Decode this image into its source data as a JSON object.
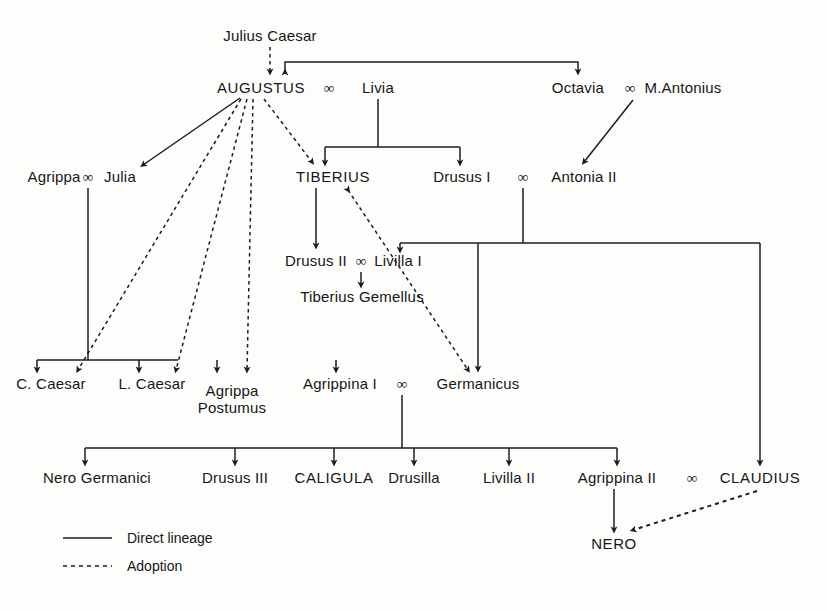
{
  "diagram": {
    "line_color": "#1c1c1c",
    "text_color": "#161616",
    "background": "#fdfdfc"
  },
  "legend": {
    "direct_label": "Direct lineage",
    "adoption_label": "Adoption"
  },
  "marriage_symbol": "∞",
  "people": [
    {
      "id": "julius_caesar",
      "label": "Julius Caesar",
      "x": 270,
      "y": 36,
      "emperor": false
    },
    {
      "id": "augustus",
      "label": "AUGUSTUS",
      "x": 261,
      "y": 88,
      "emperor": true
    },
    {
      "id": "livia",
      "label": "Livia",
      "x": 378,
      "y": 88,
      "emperor": false
    },
    {
      "id": "octavia",
      "label": "Octavia",
      "x": 578,
      "y": 88,
      "emperor": false
    },
    {
      "id": "m_antonius",
      "label": "M.Antonius",
      "x": 683,
      "y": 88,
      "emperor": false
    },
    {
      "id": "agrippa",
      "label": "Agrippa",
      "x": 54,
      "y": 177,
      "emperor": false
    },
    {
      "id": "julia",
      "label": "Julia",
      "x": 120,
      "y": 177,
      "emperor": false
    },
    {
      "id": "tiberius",
      "label": "TIBERIUS",
      "x": 333,
      "y": 177,
      "emperor": true
    },
    {
      "id": "drusus_i",
      "label": "Drusus I",
      "x": 462,
      "y": 177,
      "emperor": false
    },
    {
      "id": "antonia_ii",
      "label": "Antonia II",
      "x": 584,
      "y": 177,
      "emperor": false
    },
    {
      "id": "drusus_ii",
      "label": "Drusus II",
      "x": 316,
      "y": 261,
      "emperor": false
    },
    {
      "id": "livilla_i",
      "label": "Livilla I",
      "x": 398,
      "y": 261,
      "emperor": false
    },
    {
      "id": "tiberius_gemellus",
      "label": "Tiberius Gemellus",
      "x": 362,
      "y": 297,
      "emperor": false
    },
    {
      "id": "c_caesar",
      "label": "C. Caesar",
      "x": 51,
      "y": 384,
      "emperor": false
    },
    {
      "id": "l_caesar",
      "label": "L. Caesar",
      "x": 152,
      "y": 384,
      "emperor": false
    },
    {
      "id": "agrippa_postumus",
      "label": "Agrippa\nPostumus",
      "x": 232,
      "y": 391,
      "emperor": false
    },
    {
      "id": "agrippina_i",
      "label": "Agrippina I",
      "x": 340,
      "y": 384,
      "emperor": false
    },
    {
      "id": "germanicus",
      "label": "Germanicus",
      "x": 478,
      "y": 384,
      "emperor": false
    },
    {
      "id": "nero_germanici",
      "label": "Nero Germanici",
      "x": 97,
      "y": 478,
      "emperor": false
    },
    {
      "id": "drusus_iii",
      "label": "Drusus III",
      "x": 235,
      "y": 478,
      "emperor": false
    },
    {
      "id": "caligula",
      "label": "CALIGULA",
      "x": 334,
      "y": 478,
      "emperor": true
    },
    {
      "id": "drusilla",
      "label": "Drusilla",
      "x": 414,
      "y": 478,
      "emperor": false
    },
    {
      "id": "livilla_ii",
      "label": "Livilla II",
      "x": 509,
      "y": 478,
      "emperor": false
    },
    {
      "id": "agrippina_ii",
      "label": "Agrippina II",
      "x": 617,
      "y": 478,
      "emperor": false
    },
    {
      "id": "claudius",
      "label": "CLAUDIUS",
      "x": 760,
      "y": 478,
      "emperor": true
    },
    {
      "id": "nero",
      "label": "NERO",
      "x": 614,
      "y": 544,
      "emperor": true
    }
  ],
  "marriages": [
    {
      "id": "augustus_livia",
      "x": 329,
      "y": 88
    },
    {
      "id": "octavia_antonius",
      "x": 630,
      "y": 88
    },
    {
      "id": "agrippa_julia",
      "x": 88,
      "y": 177
    },
    {
      "id": "drusus_antonia",
      "x": 523,
      "y": 177
    },
    {
      "id": "drususii_livilla",
      "x": 361,
      "y": 261
    },
    {
      "id": "agrippina_germanicus",
      "x": 402,
      "y": 384
    },
    {
      "id": "agrippina_claudius",
      "x": 692,
      "y": 478
    }
  ],
  "edges": {
    "direct": [
      {
        "id": "jc-bar-to-augustus",
        "desc": "Julius Caesar descent bar to Augustus and Octavia"
      },
      {
        "id": "livia-to-children",
        "desc": "Livia to Tiberius and Drusus I"
      },
      {
        "id": "antonius-to-antonia",
        "desc": "M.Antonius marriage to Antonia II"
      },
      {
        "id": "tiberius-drususii",
        "desc": "Tiberius to Drusus II"
      },
      {
        "id": "drususii-gemellus",
        "desc": "Drusus II and Livilla I to Tiberius Gemellus"
      },
      {
        "id": "drusus-antonia-kids",
        "desc": "Drusus I and Antonia II to Livilla I, Germanicus, Claudius"
      },
      {
        "id": "agrippa-julia-kids",
        "desc": "Agrippa and Julia to C.Caesar, L.Caesar, Agrippa Postumus, Agrippina I"
      },
      {
        "id": "germanicus-kids",
        "desc": "Agrippina I and Germanicus to six children"
      },
      {
        "id": "agrippinaii-nero",
        "desc": "Agrippina II to Nero"
      },
      {
        "id": "augustus-julia",
        "desc": "Augustus to Julia"
      }
    ],
    "adoption": [
      {
        "id": "jc-adopts-augustus",
        "desc": "Julius Caesar adopts Augustus"
      },
      {
        "id": "augustus-adopts-ccaesar",
        "desc": "Augustus adopts C. Caesar"
      },
      {
        "id": "augustus-adopts-lcaesar",
        "desc": "Augustus adopts L. Caesar"
      },
      {
        "id": "augustus-adopts-postumus",
        "desc": "Augustus adopts Agrippa Postumus"
      },
      {
        "id": "augustus-adopts-tiberius",
        "desc": "Augustus adopts Tiberius"
      },
      {
        "id": "tiberius-adopts-germanicus",
        "desc": "Tiberius adopts Germanicus"
      },
      {
        "id": "claudius-adopts-nero",
        "desc": "Claudius adopts Nero"
      }
    ]
  }
}
